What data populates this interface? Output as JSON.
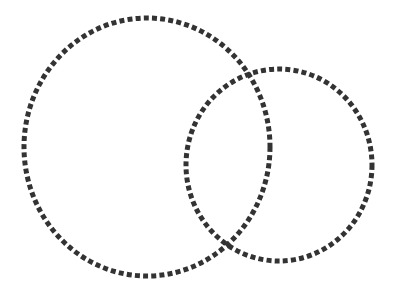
{
  "diagram": {
    "type": "venn",
    "background": "#ffffff",
    "stroke_color": "#333333",
    "stroke_width": 5,
    "dash_pattern": "5 3.2",
    "shapes": [
      {
        "id": "large-circle",
        "label": "Large dotted circle",
        "cx": 147,
        "cy": 147,
        "rx": 123,
        "ry": 129
      },
      {
        "id": "small-circle",
        "label": "Small dotted circle",
        "cx": 279,
        "cy": 165,
        "rx": 93,
        "ry": 96
      }
    ]
  }
}
